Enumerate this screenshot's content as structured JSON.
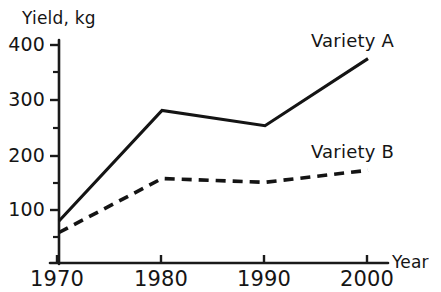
{
  "chart_data": {
    "type": "line",
    "title": "",
    "xlabel": "Year",
    "ylabel": "Yield, kg",
    "x": [
      1970,
      1980,
      1990,
      2000
    ],
    "xtick_labels": [
      "1970",
      "1980",
      "1990",
      "2000"
    ],
    "ytick_labels": [
      "100",
      "200",
      "300",
      "400"
    ],
    "yticks_major": [
      100,
      200,
      300,
      400
    ],
    "yticks_minor": [
      50,
      150,
      250,
      350
    ],
    "xlim": [
      1970,
      2000
    ],
    "ylim": [
      0,
      420
    ],
    "grid": false,
    "legend_position": "inline-right",
    "series": [
      {
        "name": "Variety A",
        "style": "solid",
        "color": "#141414",
        "values": [
          77,
          280,
          252,
          375
        ]
      },
      {
        "name": "Variety B",
        "style": "dashed",
        "color": "#141414",
        "values": [
          56,
          155,
          148,
          170
        ]
      }
    ],
    "annotations": [
      {
        "text": "Variety A",
        "x": 1998,
        "y": 400
      },
      {
        "text": "Variety B",
        "x": 1998,
        "y": 205
      }
    ]
  },
  "labels": {
    "y_axis_title": "Yield, kg",
    "x_axis_title": "Year",
    "y_400": "400",
    "y_300": "300",
    "y_200": "200",
    "y_100": "100",
    "x_1970": "1970",
    "x_1980": "1980",
    "x_1990": "1990",
    "x_2000": "2000",
    "series_a": "Variety A",
    "series_b": "Variety B"
  }
}
